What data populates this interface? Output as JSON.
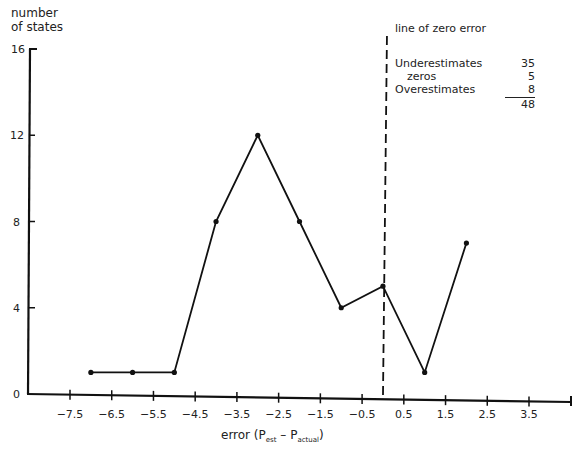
{
  "chart_data": {
    "type": "line",
    "title": "",
    "xlabel": "error (P_est − P_actual)",
    "ylabel": "number of states",
    "x": [
      -7,
      -6,
      -5,
      -4,
      -3,
      -2,
      -1,
      0,
      1,
      2
    ],
    "series": [
      {
        "name": "number of states",
        "values": [
          1,
          1,
          1,
          8,
          12,
          8,
          4,
          5,
          1,
          7
        ]
      }
    ],
    "xticks": [
      "-7.5",
      "-6.5",
      "-5.5",
      "-4.5",
      "-3.5",
      "-2.5",
      "-1.5",
      "-0.5",
      "0.5",
      "1.5",
      "2.5",
      "3.5"
    ],
    "yticks": [
      "0",
      "4",
      "8",
      "12",
      "16"
    ],
    "xlim": [
      -8,
      4
    ],
    "ylim": [
      0,
      16
    ],
    "grid": false,
    "annotations": [
      {
        "type": "vline",
        "x": 0,
        "style": "dashed",
        "label": "line of zero error"
      }
    ],
    "summary_table": [
      {
        "label": "Underestimates",
        "value": 35
      },
      {
        "label": "zeros",
        "value": 5
      },
      {
        "label": "Overestimates",
        "value": 8
      },
      {
        "label": "total",
        "value": 48
      }
    ]
  },
  "axes": {
    "ylabel_line1": "number",
    "ylabel_line2": "of states",
    "xlabel_prefix": "error (P",
    "xlabel_sub1": "est",
    "xlabel_mid": " – P",
    "xlabel_sub2": "actual",
    "xlabel_suffix": ")"
  },
  "legend": {
    "title": "line of zero error",
    "rows": [
      {
        "label": "Underestimates",
        "value": "35"
      },
      {
        "label": "zeros",
        "value": "5"
      },
      {
        "label": "Overestimates",
        "value": "8"
      }
    ],
    "total": "48"
  }
}
